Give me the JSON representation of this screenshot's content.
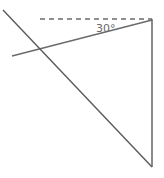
{
  "diagram": {
    "angle_label": "30°",
    "colors": {
      "line": "#5a5a5a",
      "dashed": "#222222",
      "label": "#666666",
      "background": "#ffffff"
    },
    "elements": [
      {
        "name": "horizontal-dashed-reference-line",
        "x1": 40,
        "y1": 19,
        "x2": 152,
        "y2": 19
      },
      {
        "name": "vertical-line",
        "x1": 152,
        "y1": 19,
        "x2": 152,
        "y2": 167
      },
      {
        "name": "shallow-line",
        "x1": 12,
        "y1": 56,
        "x2": 152,
        "y2": 20
      },
      {
        "name": "steep-line",
        "x1": 3,
        "y1": 10,
        "x2": 152,
        "y2": 167
      }
    ]
  }
}
